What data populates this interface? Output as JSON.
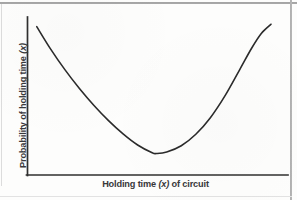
{
  "figure": {
    "background_color": "#fdfdfc",
    "ink_color": "#2b2b2b",
    "rule_color": "#9a9a9a"
  },
  "axes": {
    "y_label_prefix": "Probability of holding time ",
    "y_label_variable": "(x)",
    "y_label_suffix": "",
    "x_label_prefix": "Holding time ",
    "x_label_variable": "(x)",
    "x_label_suffix": " of circuit"
  },
  "chart_data": {
    "type": "line",
    "title": "",
    "subtitle": "",
    "xlabel": "Holding time (x) of circuit",
    "ylabel": "Probability of holding time (x)",
    "grid": false,
    "legend": false,
    "legend_position": "none",
    "axis_ticks": {
      "x": [],
      "y": []
    },
    "xlim": [
      0,
      1
    ],
    "ylim": [
      0,
      1
    ],
    "annotations": [],
    "series": [
      {
        "name": "Probability density of holding time",
        "shape": "u-shaped (bathtub) convex curve",
        "line_color": "#2b2b2b",
        "line_width": 1.6,
        "x": [
          0.034,
          0.09,
          0.15,
          0.21,
          0.27,
          0.33,
          0.39,
          0.45,
          0.51,
          0.528,
          0.57,
          0.63,
          0.69,
          0.75,
          0.81,
          0.87,
          0.92,
          0.96,
          1.0
        ],
        "y": [
          0.975,
          0.856,
          0.742,
          0.64,
          0.548,
          0.466,
          0.394,
          0.334,
          0.292,
          0.288,
          0.296,
          0.33,
          0.392,
          0.482,
          0.6,
          0.74,
          0.858,
          0.938,
          0.988
        ],
        "minimum_point": {
          "x": 0.528,
          "y": 0.288
        },
        "left_endpoint": {
          "x": 0.034,
          "y": 0.975
        },
        "right_endpoint": {
          "x": 1.0,
          "y": 0.988
        }
      }
    ]
  }
}
